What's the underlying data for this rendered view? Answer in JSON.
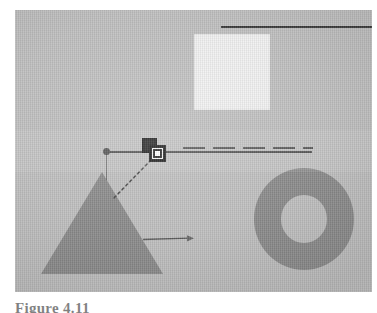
{
  "page": {
    "background_color": "#ffffff",
    "width": 377,
    "height": 313
  },
  "figure": {
    "caption": "Figure 4.11",
    "plate": {
      "background_color": "#c0c0c0",
      "left": 15,
      "top": 10,
      "width": 357,
      "height": 282
    }
  },
  "canvas": {
    "name": "drawing-canvas",
    "shapes": [
      {
        "id": "square",
        "kind": "rectangle",
        "label": "light square",
        "fill": "#f1f1f1",
        "x": 179,
        "y": 24,
        "width": 76,
        "height": 76
      },
      {
        "id": "triangle",
        "kind": "triangle",
        "label": "gray triangle",
        "fill": "#8c8c8c",
        "x": 26,
        "y": 162,
        "width": 122,
        "height": 102
      },
      {
        "id": "ring",
        "kind": "annulus",
        "label": "gray ring",
        "fill": "#8c8c8c",
        "x": 239,
        "y": 158,
        "width": 100,
        "height": 102,
        "hole_width": 46,
        "hole_height": 48
      }
    ],
    "guides": [
      {
        "id": "top-rule",
        "kind": "line",
        "style": "solid",
        "color": "#3a3a3a",
        "x1": 206,
        "y1": 17,
        "x2": 377,
        "y2": 17
      },
      {
        "id": "horizontal-axis",
        "kind": "line",
        "style": "solid",
        "color": "#4a4a4a",
        "x1": 92,
        "y1": 142,
        "x2": 297,
        "y2": 142
      },
      {
        "id": "horizontal-axis-ghost",
        "kind": "line",
        "style": "dashed",
        "color": "#4f4f4f",
        "x1": 168,
        "y1": 138,
        "x2": 298,
        "y2": 138
      },
      {
        "id": "drop-line",
        "kind": "line",
        "style": "solid",
        "color": "#3c3c3c",
        "x1": 91,
        "y1": 144,
        "x2": 91,
        "y2": 170
      },
      {
        "id": "diagonal-connector",
        "kind": "line",
        "style": "dotted",
        "color": "#4a4a4a",
        "x1": 136,
        "y1": 150,
        "x2": 97,
        "y2": 190
      },
      {
        "id": "pointer-arrow",
        "kind": "arrow",
        "style": "solid",
        "color": "#5a5a5a",
        "x1": 128,
        "y1": 229,
        "x2": 178,
        "y2": 226
      }
    ],
    "handles": [
      {
        "id": "line-endpoint-handle",
        "kind": "round-handle",
        "color": "#4a4a4a",
        "x": 88,
        "y": 138,
        "size": 7
      }
    ],
    "cursor": {
      "id": "duplicate-cursor",
      "label": "duplicate / copy marker",
      "back_square_fill": "#1c1c1c",
      "front_square_fill": "#ffffff",
      "outline": "#111111",
      "x": 127,
      "y": 128,
      "size": 25
    }
  }
}
